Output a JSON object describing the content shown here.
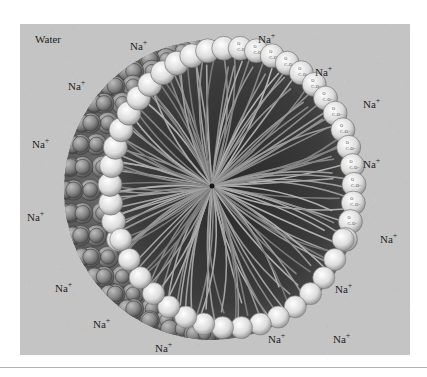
{
  "figure": {
    "panel_background": "#c4c4c4",
    "medium_label": "Water",
    "ion_label": {
      "symbol": "Na",
      "charge": "+"
    },
    "ions": [
      {
        "x": 130,
        "y": 50
      },
      {
        "x": 68,
        "y": 90
      },
      {
        "x": 32,
        "y": 148
      },
      {
        "x": 27,
        "y": 221
      },
      {
        "x": 55,
        "y": 292
      },
      {
        "x": 93,
        "y": 328
      },
      {
        "x": 155,
        "y": 352
      },
      {
        "x": 258,
        "y": 43
      },
      {
        "x": 315,
        "y": 76
      },
      {
        "x": 363,
        "y": 108
      },
      {
        "x": 363,
        "y": 168
      },
      {
        "x": 380,
        "y": 243
      },
      {
        "x": 335,
        "y": 293
      },
      {
        "x": 268,
        "y": 343
      },
      {
        "x": 333,
        "y": 343
      }
    ],
    "head_group": {
      "line1": "O",
      "line2": "C–O",
      "charge": "−"
    },
    "colors": {
      "panel": "#c4c4c4",
      "sphere_light": "#f2f2f2",
      "sphere_mid": "#a8a8a8",
      "sphere_dark": "#5c5c5c",
      "interior": "#3e3e3e",
      "tail": "#9a9a9a",
      "text": "#1e1e1e"
    }
  }
}
